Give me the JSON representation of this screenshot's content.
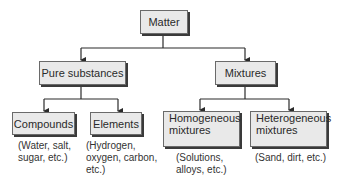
{
  "diagram": {
    "root": {
      "label": "Matter"
    },
    "level1": [
      {
        "label": "Pure substances"
      },
      {
        "label": "Mixtures"
      }
    ],
    "level2": [
      {
        "label": "Compounds",
        "note_lines": [
          "(Water, salt,",
          "sugar, etc.)"
        ]
      },
      {
        "label": "Elements",
        "note_lines": [
          "(Hydrogen,",
          "oxygen, carbon,",
          "etc.)"
        ]
      },
      {
        "label_lines": [
          "Homogeneous",
          "mixtures"
        ],
        "note_lines": [
          "(Solutions,",
          "alloys, etc.)"
        ]
      },
      {
        "label_lines": [
          "Heterogeneous",
          "mixtures"
        ],
        "note_lines": [
          "(Sand, dirt, etc.)"
        ]
      }
    ],
    "colors": {
      "box_fill": "#e9e9e9",
      "line": "#2a2a2a"
    }
  }
}
